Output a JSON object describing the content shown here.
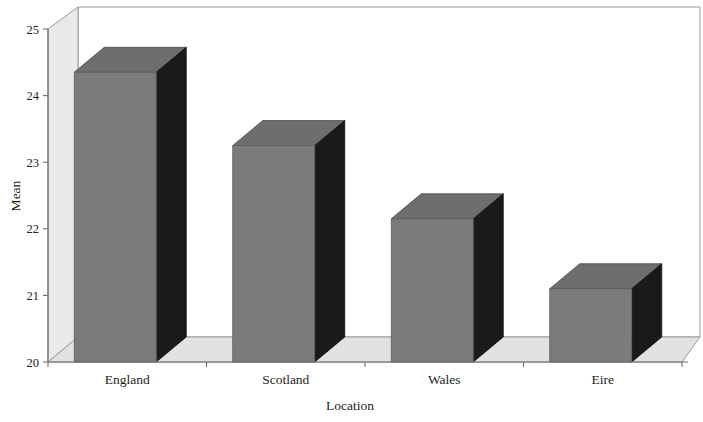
{
  "chart_data": {
    "type": "bar",
    "title": "",
    "subtitle": "",
    "categories": [
      "England",
      "Scotland",
      "Wales",
      "Eire"
    ],
    "values": [
      24.35,
      23.25,
      22.15,
      21.1
    ],
    "xlabel": "Location",
    "ylabel": "Mean",
    "ylim": [
      20,
      25
    ],
    "yticks": [
      "20",
      "21",
      "22",
      "23",
      "24",
      "25"
    ],
    "grid": false,
    "legend": null,
    "style": "3d-bar",
    "colors": {
      "bar_front": "#7b7b7b",
      "bar_top": "#6e6e6e",
      "bar_side": "#1a1a1a",
      "wall": "#e9e9e9",
      "floor": "#e2e2e2",
      "background": "#ffffff",
      "axis_line": "#8a8a8a",
      "text": "#1e1e1e"
    }
  },
  "axes": {
    "y_title": "Mean",
    "x_title": "Location",
    "y_ticks": [
      {
        "label": "25",
        "value": 25
      },
      {
        "label": "24",
        "value": 24
      },
      {
        "label": "23",
        "value": 23
      },
      {
        "label": "22",
        "value": 22
      },
      {
        "label": "21",
        "value": 21
      },
      {
        "label": "20",
        "value": 20
      }
    ]
  },
  "bars": [
    {
      "category": "England",
      "value": 24.35
    },
    {
      "category": "Scotland",
      "value": 23.25
    },
    {
      "category": "Wales",
      "value": 22.15
    },
    {
      "category": "Eire",
      "value": 21.1
    }
  ]
}
